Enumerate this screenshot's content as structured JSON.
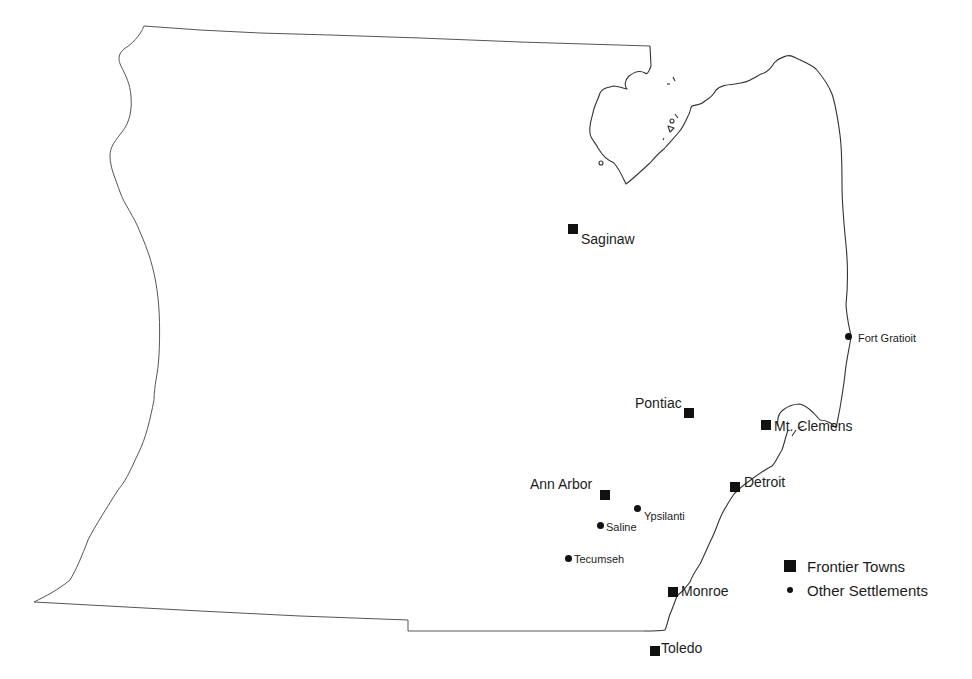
{
  "map": {
    "type": "reference map",
    "region": "southeastern Michigan frontier",
    "background_color": "#ffffff",
    "line_color": "#555555",
    "marker_color": "#111111"
  },
  "frontier_towns": [
    {
      "name": "Saginaw",
      "marker_x": 573,
      "marker_y": 229,
      "label_x": 581,
      "label_y": 232
    },
    {
      "name": "Pontiac",
      "marker_x": 689,
      "marker_y": 413,
      "label_x": 635,
      "label_y": 396
    },
    {
      "name": "Mt. Clemens",
      "marker_x": 766,
      "marker_y": 425,
      "label_x": 774,
      "label_y": 419
    },
    {
      "name": "Detroit",
      "marker_x": 735,
      "marker_y": 487,
      "label_x": 744,
      "label_y": 475
    },
    {
      "name": "Ann Arbor",
      "marker_x": 605,
      "marker_y": 495,
      "label_x": 530,
      "label_y": 477
    },
    {
      "name": "Monroe",
      "marker_x": 673,
      "marker_y": 592,
      "label_x": 681,
      "label_y": 584
    },
    {
      "name": "Toledo",
      "marker_x": 655,
      "marker_y": 651,
      "label_x": 661,
      "label_y": 641
    }
  ],
  "other_settlements": [
    {
      "name": "Fort Gratioit",
      "marker_x": 849,
      "marker_y": 337,
      "label_x": 858,
      "label_y": 333
    },
    {
      "name": "Ypsilanti",
      "marker_x": 638,
      "marker_y": 509,
      "label_x": 645,
      "label_y": 511
    },
    {
      "name": "Saline",
      "marker_x": 601,
      "marker_y": 526,
      "label_x": 606,
      "label_y": 522
    },
    {
      "name": "Tecumseh",
      "marker_x": 569,
      "marker_y": 559,
      "label_x": 574,
      "label_y": 554
    }
  ],
  "legend": {
    "items": [
      {
        "symbol": "square",
        "label": "Frontier Towns"
      },
      {
        "symbol": "dot",
        "label": "Other Settlements"
      }
    ]
  }
}
